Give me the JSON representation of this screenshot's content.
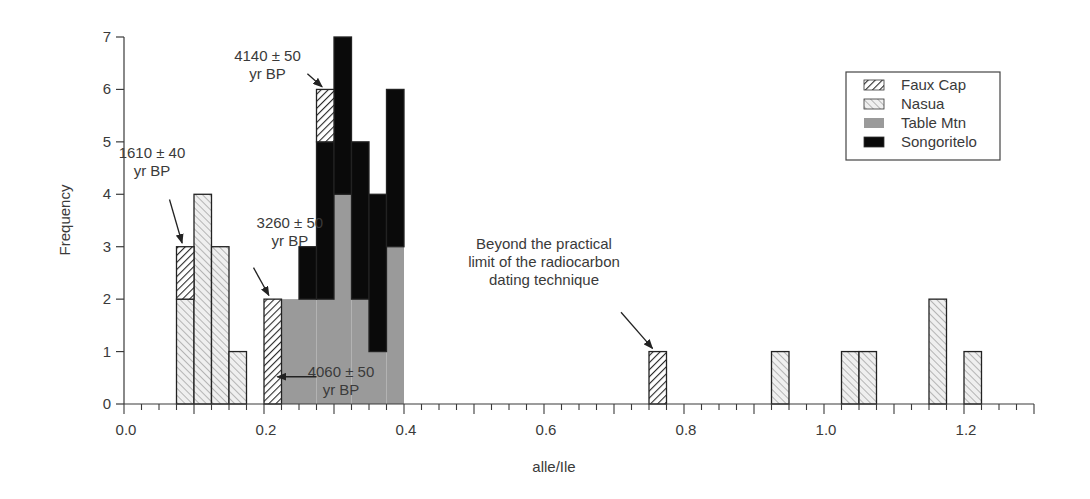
{
  "chart_data": {
    "type": "bar",
    "stacked": true,
    "title": "",
    "xlabel": "alle/Ile",
    "ylabel": "Frequency",
    "xlim": [
      0.0,
      1.3
    ],
    "ylim": [
      0,
      7
    ],
    "bin_width": 0.025,
    "x_ticks": [
      0.0,
      0.2,
      0.4,
      0.6,
      0.8,
      1.0,
      1.2
    ],
    "x_tick_labels": [
      "0.0",
      "0.2",
      "0.4",
      "0.6",
      "0.8",
      "1.0",
      "1.2"
    ],
    "y_ticks": [
      0,
      1,
      2,
      3,
      4,
      5,
      6,
      7
    ],
    "y_tick_labels": [
      "0",
      "1",
      "2",
      "3",
      "4",
      "5",
      "6",
      "7"
    ],
    "grid": false,
    "legend_position": "upper right",
    "series_order": [
      "Nasua",
      "Table Mtn",
      "Songoritelo",
      "Faux Cap"
    ],
    "series": [
      {
        "name": "Faux Cap",
        "pattern": "dense-hatch",
        "bins": [
          {
            "x0": 0.075,
            "x1": 0.1,
            "base": 2,
            "count": 1
          },
          {
            "x0": 0.2,
            "x1": 0.225,
            "base": 0,
            "count": 2
          },
          {
            "x0": 0.275,
            "x1": 0.3,
            "base": 5,
            "count": 1
          },
          {
            "x0": 0.75,
            "x1": 0.775,
            "base": 0,
            "count": 1
          }
        ]
      },
      {
        "name": "Nasua",
        "pattern": "light-hatch",
        "bins": [
          {
            "x0": 0.075,
            "x1": 0.1,
            "base": 0,
            "count": 2
          },
          {
            "x0": 0.1,
            "x1": 0.125,
            "base": 0,
            "count": 4
          },
          {
            "x0": 0.125,
            "x1": 0.15,
            "base": 0,
            "count": 3
          },
          {
            "x0": 0.15,
            "x1": 0.175,
            "base": 0,
            "count": 1
          },
          {
            "x0": 0.925,
            "x1": 0.95,
            "base": 0,
            "count": 1
          },
          {
            "x0": 1.025,
            "x1": 1.05,
            "base": 0,
            "count": 1
          },
          {
            "x0": 1.05,
            "x1": 1.075,
            "base": 0,
            "count": 1
          },
          {
            "x0": 1.15,
            "x1": 1.175,
            "base": 0,
            "count": 2
          },
          {
            "x0": 1.2,
            "x1": 1.225,
            "base": 0,
            "count": 1
          }
        ]
      },
      {
        "name": "Table Mtn",
        "pattern": "gray",
        "bins": [
          {
            "x0": 0.225,
            "x1": 0.25,
            "base": 0,
            "count": 2
          },
          {
            "x0": 0.25,
            "x1": 0.275,
            "base": 0,
            "count": 2
          },
          {
            "x0": 0.275,
            "x1": 0.3,
            "base": 0,
            "count": 2
          },
          {
            "x0": 0.3,
            "x1": 0.325,
            "base": 0,
            "count": 4
          },
          {
            "x0": 0.325,
            "x1": 0.35,
            "base": 0,
            "count": 2
          },
          {
            "x0": 0.35,
            "x1": 0.375,
            "base": 0,
            "count": 1
          },
          {
            "x0": 0.375,
            "x1": 0.4,
            "base": 0,
            "count": 3
          }
        ]
      },
      {
        "name": "Songoritelo",
        "pattern": "black",
        "bins": [
          {
            "x0": 0.25,
            "x1": 0.275,
            "base": 2,
            "count": 1
          },
          {
            "x0": 0.275,
            "x1": 0.3,
            "base": 2,
            "count": 3
          },
          {
            "x0": 0.3,
            "x1": 0.325,
            "base": 4,
            "count": 3
          },
          {
            "x0": 0.325,
            "x1": 0.35,
            "base": 2,
            "count": 3
          },
          {
            "x0": 0.35,
            "x1": 0.375,
            "base": 1,
            "count": 3
          },
          {
            "x0": 0.375,
            "x1": 0.4,
            "base": 3,
            "count": 3
          }
        ]
      }
    ],
    "legend": [
      {
        "label": "Faux Cap",
        "pattern": "dense-hatch"
      },
      {
        "label": "Nasua",
        "pattern": "light-hatch"
      },
      {
        "label": "Table Mtn",
        "pattern": "gray"
      },
      {
        "label": "Songoritelo",
        "pattern": "black"
      }
    ],
    "annotations": [
      {
        "lines": [
          "4140 ± 50",
          "yr BP"
        ],
        "text_x": 0.205,
        "text_y": 6.55,
        "arrow_from": [
          0.262,
          6.3
        ],
        "arrow_to": [
          0.283,
          6.05
        ]
      },
      {
        "lines": [
          "1610 ± 40",
          "yr BP"
        ],
        "text_x": 0.04,
        "text_y": 4.7,
        "arrow_from": [
          0.065,
          3.9
        ],
        "arrow_to": [
          0.083,
          3.07
        ]
      },
      {
        "lines": [
          "3260 ± 50",
          "yr BP"
        ],
        "text_x": 0.237,
        "text_y": 3.35,
        "arrow_from": [
          0.185,
          2.6
        ],
        "arrow_to": [
          0.207,
          2.07
        ]
      },
      {
        "lines": [
          "4060 ± 50",
          "yr BP"
        ],
        "text_x": 0.31,
        "text_y": 0.52,
        "arrow_from": [
          0.275,
          0.52
        ],
        "arrow_to": [
          0.219,
          0.52
        ]
      },
      {
        "lines": [
          "Beyond the practical",
          "limit of the radiocarbon",
          "dating technique"
        ],
        "text_x": 0.6,
        "text_y": 2.95,
        "arrow_from": [
          0.71,
          1.75
        ],
        "arrow_to": [
          0.755,
          1.06
        ]
      }
    ]
  },
  "colors": {
    "axis": "#3a3a3a",
    "faux_cap_stroke": "#2a2a2a",
    "nasua_fill": "#e6e6e6",
    "table_mtn_fill": "#9a9a9a",
    "songoritelo_fill": "#0a0a0a"
  }
}
